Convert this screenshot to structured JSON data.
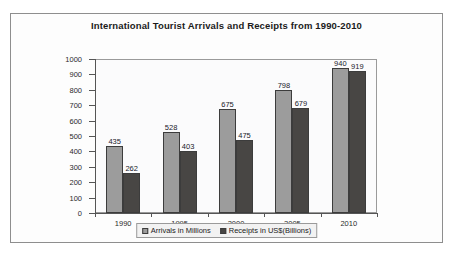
{
  "chart_data": {
    "type": "bar",
    "title": "International Tourist Arrivals and Receipts from 1990-2010",
    "xlabel": "",
    "ylabel": "",
    "ylim": [
      0,
      1000
    ],
    "yticks": [
      0,
      100,
      200,
      300,
      400,
      500,
      600,
      700,
      800,
      900,
      1000
    ],
    "ytick_labels": [
      "0",
      "100",
      "200",
      "300",
      "400",
      "500",
      "600",
      "700",
      "800",
      "900",
      "1000"
    ],
    "grid": false,
    "legend_position": "bottom",
    "categories": [
      "1990",
      "1995",
      "2000",
      "2005",
      "2010"
    ],
    "series": [
      {
        "name": "Arrivals in Millions",
        "color": "#9c9c9c",
        "values": [
          435,
          528,
          675,
          798,
          940
        ],
        "labels": [
          "435",
          "528",
          "675",
          "798",
          "940"
        ]
      },
      {
        "name": "Receipts in US$(Billions)",
        "color": "#484644",
        "values": [
          262,
          403,
          475,
          679,
          919
        ],
        "labels": [
          "262",
          "403",
          "475",
          "679",
          "919"
        ]
      }
    ]
  },
  "legend": {
    "entries": [
      {
        "label": "Arrivals in Millions",
        "swatch": "legend-swatch-arrivals"
      },
      {
        "label": "Receipts in US$(Billions)",
        "swatch": "legend-swatch-receipts"
      }
    ]
  }
}
